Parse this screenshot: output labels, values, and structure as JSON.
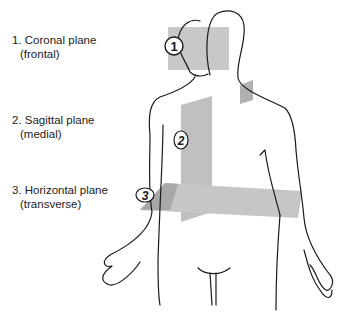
{
  "labels": [
    {
      "number": "1.",
      "name": "Coronal plane",
      "alt": "(frontal)"
    },
    {
      "number": "2.",
      "name": "Sagittal plane",
      "alt": "(medial)"
    },
    {
      "number": "3.",
      "name": "Horizontal plane",
      "alt": "(transverse)"
    }
  ],
  "markers": [
    "1",
    "2",
    "3"
  ],
  "colors": {
    "plane_light": "#c8c8c8",
    "plane_mid": "#b4b4b4",
    "plane_dark": "#9a9a9a",
    "outline": "#1a1a1a"
  }
}
